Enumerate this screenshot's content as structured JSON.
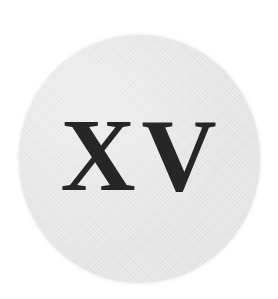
{
  "emblem": {
    "numeral_text": "XV",
    "disc_color": "#e9e9e9",
    "text_color": "#262626",
    "background_color": "#ffffff"
  }
}
